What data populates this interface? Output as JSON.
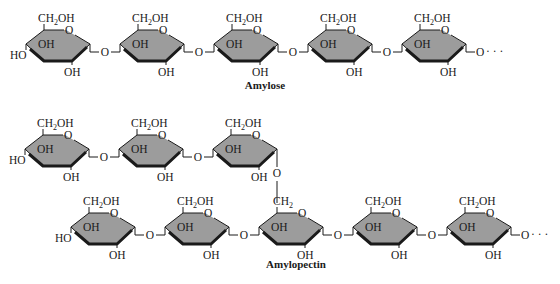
{
  "figure": {
    "type": "chemical-structure-diagram",
    "colors": {
      "ring_fill": "#9c9c9c",
      "ring_stroke": "#1a1a1a",
      "background": "#ffffff"
    },
    "ring_labels": {
      "ch2oh_main": "CH",
      "ch2oh_sub": "2",
      "ch2oh_tail": "OH",
      "ch2_main": "CH",
      "ch2_sub": "2",
      "ring_oxygen": "O",
      "oh": "OH",
      "ho": "HO",
      "link_oxygen": "O",
      "continuation": "· · ·"
    },
    "amylose": {
      "caption": "Amylose",
      "ring_count": 5,
      "links": "alpha(1→4)"
    },
    "amylopectin": {
      "caption": "Amylopectin",
      "branch_row_ring_count": 3,
      "main_row_ring_count": 5,
      "branch_link": "alpha(1→6)",
      "branch_point_label": "CH2"
    }
  }
}
